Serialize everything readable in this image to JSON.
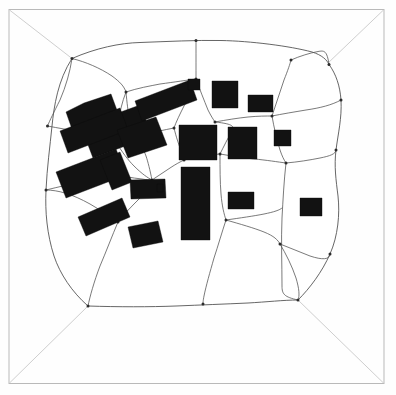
{
  "figure": {
    "canvas": {
      "width": 396,
      "height": 395
    },
    "colors": {
      "background": "#fefefe",
      "building_fill": "#121212",
      "boundary_stroke": "#4a4a4a",
      "plot_stroke": "#585858",
      "frame_stroke": "#b9b9b9",
      "node_fill": "#2b2b2b"
    }
  },
  "chart_data": {
    "type": "map",
    "xlabel": "",
    "ylabel": "",
    "buildings_count": 19,
    "plots_count": 18
  },
  "frame": {
    "name": "outer-frame",
    "rect": {
      "x": 9,
      "y": 9.5,
      "w": 375,
      "h": 374
    }
  },
  "corner_links": [
    {
      "name": "corner-link-top-left",
      "path": "M 9.5,10 L 72,58.5"
    },
    {
      "name": "corner-link-top-right",
      "path": "M 383.5,10 L 327,64"
    },
    {
      "name": "corner-link-bottom-left",
      "path": "M 9.5,383 L 88,306"
    },
    {
      "name": "corner-link-bottom-right",
      "path": "M 383.5,383 L 298,300"
    }
  ],
  "blob": {
    "name": "settlement-outline",
    "path": "M 72,58.5 C 96,48 120,43 140,42.5 C 168,41.5 196,40 221,40.5 C 250,41 290,46 312,52 C 322,55 327,60 329,64.5 C 336,74 340,86 341,100 C 342,118 338,134 336,150 C 334,166 336,180 338,196 C 340,214 338,236 330,254 C 322,272 310,288 298,300 C 284,300 266,302 248,303 C 226,304 200,305 176,306 C 150,307 118,307 88,306 C 72,292 60,274 54,256 C 47,234 45,212 46,190 C 47,168 50,146 52,126 C 54,106 58,80 72,58.5 Z"
  },
  "plot_lines": [
    {
      "name": "plot-line-01",
      "path": "M 72,58.5 C 70,72 66,86 60,100 C 54,112 50,120 47.5,126"
    },
    {
      "name": "plot-line-02",
      "path": "M 47.5,126 C 58,128 70,130 80,132 C 92,134 104,138 116,142"
    },
    {
      "name": "plot-line-03",
      "path": "M 46,190 C 58,187 72,184 84,181 C 96,178 104,176 112,174"
    },
    {
      "name": "plot-line-04",
      "path": "M 72,58.5 C 86,62 100,68 112,76 C 120,82 124,86 126,92"
    },
    {
      "name": "plot-line-05",
      "path": "M 126,92 C 122,102 120,112 118,122 C 117,130 116,136 116,142"
    },
    {
      "name": "plot-line-06",
      "path": "M 126,92 C 138,88 150,86 160,84 C 175,82 188,80 196,79"
    },
    {
      "name": "plot-line-07",
      "path": "M 196,79 C 196,68 196,56 196,46 C 196,43 196,41.5 196,40.5"
    },
    {
      "name": "plot-line-08",
      "path": "M 196,79 C 200,90 204,100 208,110 C 211,116 213,119 215,122"
    },
    {
      "name": "plot-line-09",
      "path": "M 215,122 C 226,120 238,118 248,117 C 258,116 266,116 272,116"
    },
    {
      "name": "plot-line-10",
      "path": "M 272,116 C 276,104 280,92 284,80 C 288,70 290,64 291,60"
    },
    {
      "name": "plot-line-11",
      "path": "M 291,60 C 300,56 310,53 318,51.5 C 324,50.5 327,50 329,64.5"
    },
    {
      "name": "plot-line-12",
      "path": "M 272,116 C 282,114 294,112 306,110 C 320,108 332,105 341,100"
    },
    {
      "name": "plot-line-13",
      "path": "M 272,116 C 274,128 277,140 280,150 C 282,156 284,160 286,163"
    },
    {
      "name": "plot-line-14",
      "path": "M 286,163 C 298,162 310,160 320,158 C 330,156 336,154 336,150"
    },
    {
      "name": "plot-line-15",
      "path": "M 286,163 C 284,180 283,200 282,218 C 281,240 282,264 282,286 C 282,294 284,297 298,300"
    },
    {
      "name": "plot-line-16",
      "path": "M 116,142 C 122,152 128,160 134,166 C 142,174 148,178 152,180"
    },
    {
      "name": "plot-line-17",
      "path": "M 112,174 C 122,176 132,178 142,179 C 148,180 150,180 152,180"
    },
    {
      "name": "plot-line-18",
      "path": "M 152,180 C 158,176 164,172 170,168 C 176,164 180,162 184,160"
    },
    {
      "name": "plot-line-19",
      "path": "M 184,160 C 194,158 204,156 212,155 C 216,154.5 218,154 220,154"
    },
    {
      "name": "plot-line-20",
      "path": "M 220,154 C 224,146 228,138 232,131 C 234,127 235,124 215,122"
    },
    {
      "name": "plot-line-21",
      "path": "M 220,154 C 232,156 244,158 254,159 C 266,160 278,162 286,163"
    },
    {
      "name": "plot-line-22",
      "path": "M 220,154 C 220,168 220,182 221,194 C 222,206 224,214 226,220"
    },
    {
      "name": "plot-line-23",
      "path": "M 226,220 C 240,218 254,216 264,214 C 274,212 280,210 282,208"
    },
    {
      "name": "plot-line-24",
      "path": "M 226,220 C 222,232 218,246 214,258 C 210,272 206,286 204,296 C 203,301 203,303 203,304"
    },
    {
      "name": "plot-line-25",
      "path": "M 152,180 C 150,186 146,192 140,198 C 132,206 124,214 118,222"
    },
    {
      "name": "plot-line-26",
      "path": "M 118,222 C 112,236 106,252 100,266 C 94,282 90,296 88,306"
    },
    {
      "name": "plot-line-27",
      "path": "M 118,222 C 110,216 100,210 90,204 C 72,194 58,190 46,190"
    },
    {
      "name": "plot-line-28",
      "path": "M 226,220 C 240,224 254,228 264,232 C 274,236 278,240 280,244"
    },
    {
      "name": "plot-line-29",
      "path": "M 280,244 C 286,254 292,266 296,278 C 299,288 300,296 298,300"
    },
    {
      "name": "plot-line-30",
      "path": "M 280,244 C 290,248 300,252 310,256 C 322,260 330,260 330,254"
    },
    {
      "name": "plot-line-31",
      "path": "M 152,180 C 150,170 148,162 146,156 C 143,148 140,144 138,142 C 130,140 122,141 116,142"
    },
    {
      "name": "plot-line-32",
      "path": "M 184,160 C 182,154 180,148 178,142 C 176,136 175,132 174,128"
    },
    {
      "name": "plot-line-33",
      "path": "M 174,128 C 176,122 180,114 184,106 C 190,96 194,86 196,79"
    },
    {
      "name": "plot-line-34",
      "path": "M 174,128 C 164,130 154,132 146,134 C 136,136 130,138 126,92"
    }
  ],
  "nodes": [
    {
      "name": "node-01",
      "cx": 72,
      "cy": 58.5
    },
    {
      "name": "node-02",
      "cx": 47.5,
      "cy": 126
    },
    {
      "name": "node-03",
      "cx": 46,
      "cy": 190
    },
    {
      "name": "node-04",
      "cx": 126,
      "cy": 92
    },
    {
      "name": "node-05",
      "cx": 116,
      "cy": 142
    },
    {
      "name": "node-06",
      "cx": 196,
      "cy": 79
    },
    {
      "name": "node-07",
      "cx": 196,
      "cy": 40.5
    },
    {
      "name": "node-08",
      "cx": 215,
      "cy": 122
    },
    {
      "name": "node-09",
      "cx": 272,
      "cy": 116
    },
    {
      "name": "node-10",
      "cx": 291,
      "cy": 60
    },
    {
      "name": "node-11",
      "cx": 329,
      "cy": 64.5
    },
    {
      "name": "node-12",
      "cx": 341,
      "cy": 100
    },
    {
      "name": "node-13",
      "cx": 286,
      "cy": 163
    },
    {
      "name": "node-14",
      "cx": 336,
      "cy": 150
    },
    {
      "name": "node-15",
      "cx": 152,
      "cy": 180
    },
    {
      "name": "node-16",
      "cx": 112,
      "cy": 174
    },
    {
      "name": "node-17",
      "cx": 184,
      "cy": 160
    },
    {
      "name": "node-18",
      "cx": 220,
      "cy": 154
    },
    {
      "name": "node-19",
      "cx": 226,
      "cy": 220
    },
    {
      "name": "node-20",
      "cx": 118,
      "cy": 222
    },
    {
      "name": "node-21",
      "cx": 88,
      "cy": 306
    },
    {
      "name": "node-22",
      "cx": 203,
      "cy": 304
    },
    {
      "name": "node-23",
      "cx": 280,
      "cy": 244
    },
    {
      "name": "node-24",
      "cx": 298,
      "cy": 300
    },
    {
      "name": "node-25",
      "cx": 330,
      "cy": 254
    },
    {
      "name": "node-26",
      "cx": 174,
      "cy": 128
    },
    {
      "name": "node-27",
      "cx": 138,
      "cy": 142
    }
  ],
  "buildings": [
    {
      "name": "building-cross-nw",
      "shape": "polygon",
      "points": "84,103 111,94 118,113 140,105 152,136 93,158 82,129 73,132 66,112"
    },
    {
      "name": "building-bar-nw-long",
      "shape": "polygon",
      "points": "60,131 120,108 128,130 68,153"
    },
    {
      "name": "building-bar-n-diag",
      "shape": "polygon",
      "points": "135,101 190,80 197,100 142,121"
    },
    {
      "name": "building-bar-w-long",
      "shape": "polygon",
      "points": "56,172 116,149 126,175 66,198"
    },
    {
      "name": "building-bar-w-wing",
      "shape": "polygon",
      "points": "100,160 120,152 132,182 112,190"
    },
    {
      "name": "building-bar-sw",
      "shape": "polygon",
      "points": "78,217 122,198 130,217 86,236"
    },
    {
      "name": "building-rect-w-mid",
      "shape": "polygon",
      "points": "117,130 156,117 167,145 128,158"
    },
    {
      "name": "building-rect-w-low",
      "shape": "polygon",
      "points": "130,180 165,179 166,198 131,199"
    },
    {
      "name": "building-notch-w",
      "shape": "polygon",
      "points": "157,184 163,184 163,192 157,192"
    },
    {
      "name": "building-rect-s-small",
      "shape": "polygon",
      "points": "128,227 158,221 163,242 133,248"
    },
    {
      "name": "building-rect-c-big",
      "shape": "polygon",
      "points": "179,125 217,125 217,160 179,160"
    },
    {
      "name": "building-rect-c-tall",
      "shape": "polygon",
      "points": "181,167 210,167 210,240 181,240"
    },
    {
      "name": "building-rect-ce",
      "shape": "polygon",
      "points": "228,127 257,127 257,159 228,159"
    },
    {
      "name": "building-rect-n1",
      "shape": "polygon",
      "points": "212,81 238,81 238,108 212,108"
    },
    {
      "name": "building-rect-n2",
      "shape": "polygon",
      "points": "248,95 273,95 273,112 248,112"
    },
    {
      "name": "building-rect-e1",
      "shape": "polygon",
      "points": "274,130 291,130 291,146 274,146"
    },
    {
      "name": "building-rect-e2",
      "shape": "polygon",
      "points": "228,192 254,192 254,209 228,209"
    },
    {
      "name": "building-rect-e3",
      "shape": "polygon",
      "points": "300,198 322,198 322,216 300,216"
    },
    {
      "name": "building-rect-n3",
      "shape": "polygon",
      "points": "188,79 200,79 200,90 188,90"
    }
  ]
}
